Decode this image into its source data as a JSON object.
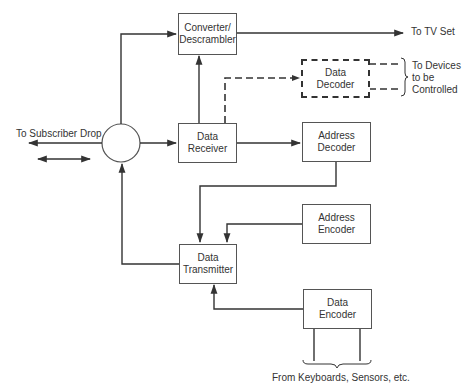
{
  "diagram": {
    "blocks": {
      "converter": "Converter/\nDescrambler",
      "data_receiver": "Data\nReceiver",
      "data_decoder": "Data\nDecoder",
      "address_decoder": "Address\nDecoder",
      "address_encoder": "Address\nEncoder",
      "data_transmitter": "Data\nTransmitter",
      "data_encoder": "Data\nEncoder"
    },
    "labels": {
      "subscriber_drop": "To Subscriber Drop",
      "tv_set": "To TV Set",
      "devices": "To Devices\nto be\nControlled",
      "inputs": "From Keyboards, Sensors, etc."
    },
    "colors": {
      "line": "#333333",
      "background": "#ffffff"
    }
  }
}
